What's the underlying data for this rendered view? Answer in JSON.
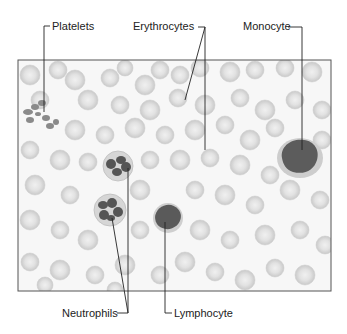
{
  "figure": {
    "labels": {
      "platelets": "Platelets",
      "erythrocytes": "Erythrocytes",
      "monocyte": "Monocyte",
      "neutrophils": "Neutrophils",
      "lymphocyte": "Lymphocyte"
    },
    "colors": {
      "background": "#ffffff",
      "frame": "#555555",
      "erythrocyte_fill": "#d4d4d4",
      "erythrocyte_center": "#ececec",
      "nucleus": "#5a5a5a",
      "cytoplasm": "#c8c8c8",
      "leader_line": "#222222",
      "text": "#222222"
    }
  }
}
